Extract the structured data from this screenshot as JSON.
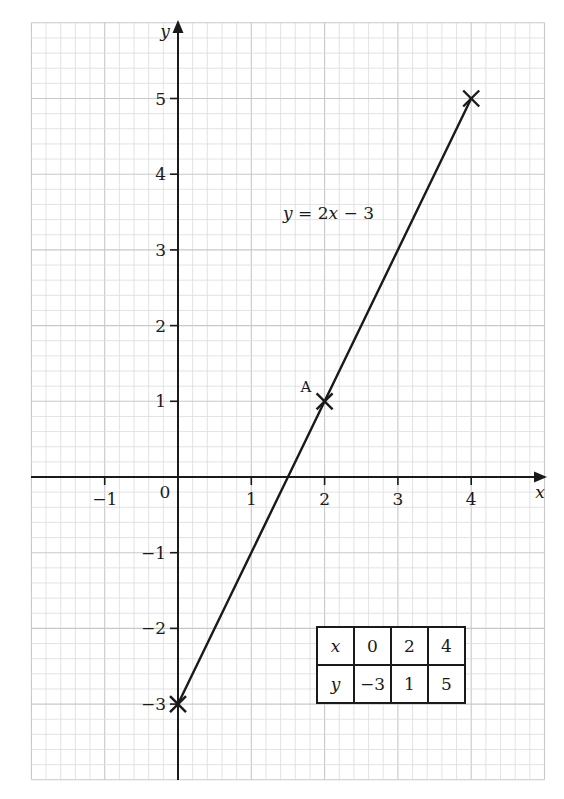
{
  "chart_data": {
    "type": "line",
    "title": "",
    "equation_label": "y = 2x − 3",
    "xlabel": "x",
    "ylabel": "y",
    "xlim": [
      -2,
      5
    ],
    "ylim": [
      -4,
      6
    ],
    "grid": true,
    "x_ticks": [
      -1,
      0,
      1,
      2,
      3,
      4
    ],
    "x_tick_labels": [
      "−1",
      "0",
      "1",
      "2",
      "3",
      "4"
    ],
    "y_ticks": [
      5,
      4,
      3,
      2,
      1,
      -1,
      -2,
      -3
    ],
    "y_tick_labels": [
      "5",
      "4",
      "3",
      "2",
      "1",
      "−1",
      "−2",
      "−3"
    ],
    "series": [
      {
        "name": "y = 2x − 3",
        "x": [
          0,
          2,
          4
        ],
        "y": [
          -3,
          1,
          5
        ],
        "marker": "x"
      }
    ],
    "annotations": [
      {
        "label": "A",
        "x": 2,
        "y": 1
      }
    ],
    "table": {
      "rows": [
        {
          "header": "x",
          "values": [
            "0",
            "2",
            "4"
          ]
        },
        {
          "header": "y",
          "values": [
            "−3",
            "1",
            "5"
          ]
        }
      ]
    }
  },
  "labels": {
    "x_axis": "x",
    "y_axis": "y",
    "origin": "0",
    "equation_lhs": "y",
    "equation_rhs": " = 2",
    "equation_x": "x",
    "equation_tail": " − 3",
    "point_a": "A"
  },
  "table": {
    "row_x_header": "x",
    "row_x_0": "0",
    "row_x_1": "2",
    "row_x_2": "4",
    "row_y_header": "y",
    "row_y_0": "−3",
    "row_y_1": "1",
    "row_y_2": "5"
  },
  "ticks": {
    "x_m1": "−1",
    "x_1": "1",
    "x_2": "2",
    "x_3": "3",
    "x_4": "4",
    "y_5": "5",
    "y_4": "4",
    "y_3": "3",
    "y_2": "2",
    "y_1": "1",
    "y_m1": "−1",
    "y_m2": "−2",
    "y_m3": "−3"
  },
  "colors": {
    "grid_minor": "#dcdcdc",
    "grid_major": "#c8c8c8",
    "ink": "#1a1a1a"
  }
}
